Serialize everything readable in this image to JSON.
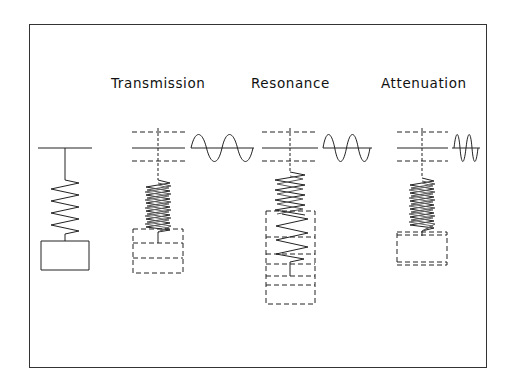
{
  "diagram": {
    "panels": [
      {
        "id": "static",
        "label": "",
        "wave": null
      },
      {
        "id": "transmission",
        "label": "Transmission",
        "wave": {
          "periods": 2,
          "x0": 191,
          "x1": 253,
          "amplitude": 13
        }
      },
      {
        "id": "resonance",
        "label": "Resonance",
        "wave": {
          "periods": 2,
          "x0": 323,
          "x1": 370,
          "amplitude": 13
        }
      },
      {
        "id": "attenuation",
        "label": "Attenuation",
        "wave": {
          "periods": 2,
          "x0": 454,
          "x1": 478,
          "amplitude": 13
        }
      }
    ],
    "colors": {
      "stroke": "#222222",
      "dashed": "#444444",
      "background": "#ffffff",
      "frame": "#333333"
    }
  }
}
